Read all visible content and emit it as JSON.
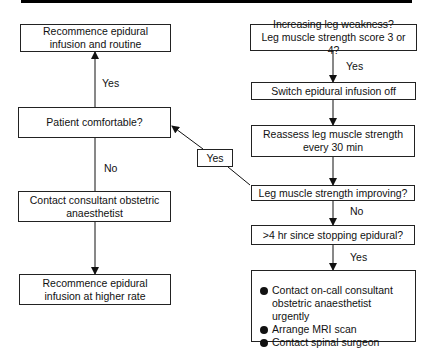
{
  "flowchart": {
    "left": {
      "recommence_routine": "Recommence epidural infusion and routine",
      "yes_label": "Yes",
      "patient_comfortable": "Patient comfortable?",
      "no_label": "No",
      "contact_consultant": "Contact consultant obstetric anaesthetist",
      "recommence_higher": "Recommence epidural infusion at higher rate"
    },
    "right": {
      "increasing_weakness_line1": "Increasing leg weakness?",
      "increasing_weakness_line2": "Leg muscle strength score 3 or 4?",
      "yes_label_1": "Yes",
      "switch_off": "Switch epidural infusion off",
      "reassess_line1": "Reassess leg muscle strength",
      "reassess_line2": "every 30 min",
      "improving": "Leg muscle strength improving?",
      "no_label": "No",
      "four_hr": ">4 hr since stopping epidural?",
      "yes_label_2": "Yes",
      "actions": [
        "Contact on-call consultant obstetric anaesthetist urgently",
        "Arrange MRI scan",
        "Contact spinal surgeon"
      ]
    },
    "connector": {
      "yes_label": "Yes"
    }
  }
}
